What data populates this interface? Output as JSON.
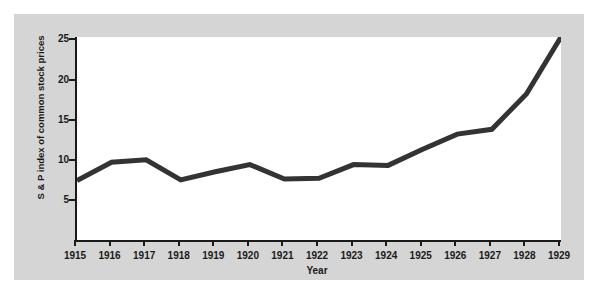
{
  "chart_data": {
    "type": "line",
    "title": "",
    "subtitle": "",
    "xlabel": "Year",
    "ylabel": "S & P index of common stock prices",
    "categories": [
      "1915",
      "1916",
      "1917",
      "1918",
      "1919",
      "1920",
      "1921",
      "1922",
      "1923",
      "1924",
      "1925",
      "1926",
      "1927",
      "1928",
      "1929"
    ],
    "x": [
      1915,
      1916,
      1917,
      1918,
      1919,
      1920,
      1921,
      1922,
      1923,
      1924,
      1925,
      1926,
      1927,
      1928,
      1929
    ],
    "values": [
      7.4,
      9.7,
      10.0,
      7.5,
      8.5,
      9.4,
      7.6,
      7.7,
      9.4,
      9.3,
      11.3,
      13.2,
      13.8,
      18.2,
      25.3
    ],
    "series": [
      {
        "name": "S & P index of common stock prices",
        "values": [
          7.4,
          9.7,
          10.0,
          7.5,
          8.5,
          9.4,
          7.6,
          7.7,
          9.4,
          9.3,
          11.3,
          13.2,
          13.8,
          18.2,
          25.3
        ]
      }
    ],
    "ylim": [
      0,
      25.3
    ],
    "xlim": [
      1915,
      1929
    ],
    "yticks": [
      5,
      10,
      15,
      20,
      25
    ],
    "ytick_labels": [
      "5",
      "10",
      "15",
      "20",
      "25"
    ],
    "xticks": [
      1915,
      1916,
      1917,
      1918,
      1919,
      1920,
      1921,
      1922,
      1923,
      1924,
      1925,
      1926,
      1927,
      1928,
      1929
    ],
    "xtick_labels": [
      "1915",
      "1916",
      "1917",
      "1918",
      "1919",
      "1920",
      "1921",
      "1922",
      "1923",
      "1924",
      "1925",
      "1926",
      "1927",
      "1928",
      "1929"
    ],
    "grid": false,
    "legend": false,
    "legend_position": "none",
    "line_color": "#333333",
    "line_width": 5,
    "axis_color": "#1a1a1a",
    "plot_background": "#ffffff",
    "figure_background": "#d5d5d5",
    "annotations": []
  }
}
